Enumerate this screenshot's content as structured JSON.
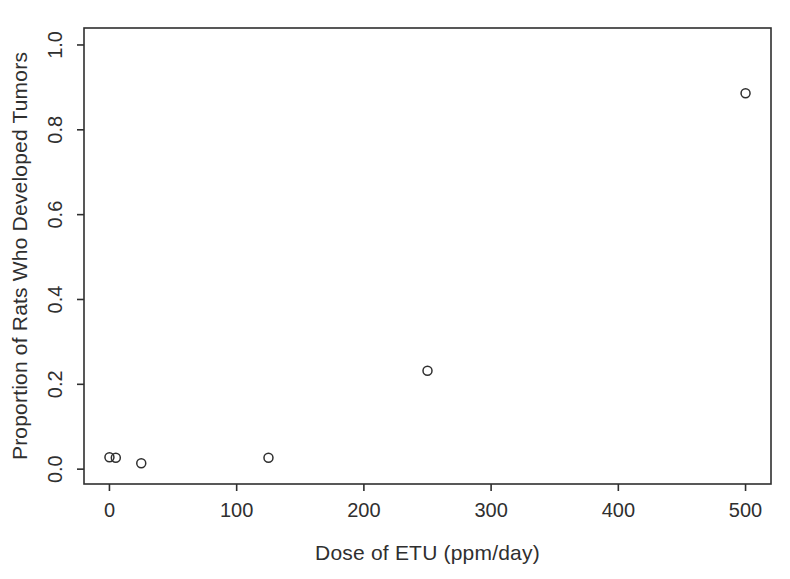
{
  "figure": {
    "background": "#ffffff",
    "ink_color": "#2f2f2f",
    "marker": "open-circle"
  },
  "chart_data": {
    "type": "scatter",
    "title": "",
    "xlabel": "Dose of ETU (ppm/day)",
    "ylabel": "Proportion of Rats Who Developed Tumors",
    "x": [
      0,
      5,
      25,
      125,
      250,
      500
    ],
    "y": [
      0.028,
      0.027,
      0.014,
      0.027,
      0.232,
      0.886
    ],
    "xlim": [
      -20,
      520
    ],
    "ylim": [
      -0.035,
      1.04
    ],
    "xticks": [
      0,
      100,
      200,
      300,
      400,
      500
    ],
    "xtick_labels": [
      "0",
      "100",
      "200",
      "300",
      "400",
      "500"
    ],
    "yticks": [
      0.0,
      0.2,
      0.4,
      0.6,
      0.8,
      1.0
    ],
    "ytick_labels": [
      "0.0",
      "0.2",
      "0.4",
      "0.6",
      "0.8",
      "1.0"
    ],
    "grid": false,
    "legend": "none",
    "box": "full",
    "marker": "open-circle"
  }
}
